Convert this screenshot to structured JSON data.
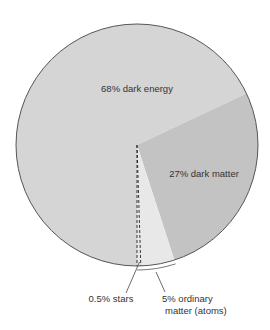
{
  "chart_data": {
    "type": "pie",
    "title": "",
    "start": "top",
    "direction": "clockwise",
    "slices": [
      {
        "name": "dark energy",
        "value": 68,
        "label": "68% dark energy",
        "color": "#d5d5d5"
      },
      {
        "name": "dark matter",
        "value": 27,
        "label": "27% dark matter",
        "color": "#c3c3c3"
      },
      {
        "name": "ordinary matter (atoms)",
        "value": 5,
        "label_lines": [
          "5% ordinary",
          "matter (atoms)"
        ],
        "color": "#e8e8e8"
      }
    ],
    "sub_slices": [
      {
        "name": "stars",
        "value": 0.5,
        "parent": "ordinary matter (atoms)",
        "label": "0.5% stars",
        "style": "dashed"
      }
    ],
    "outline_color": "#555555",
    "label_color": "#333333"
  }
}
